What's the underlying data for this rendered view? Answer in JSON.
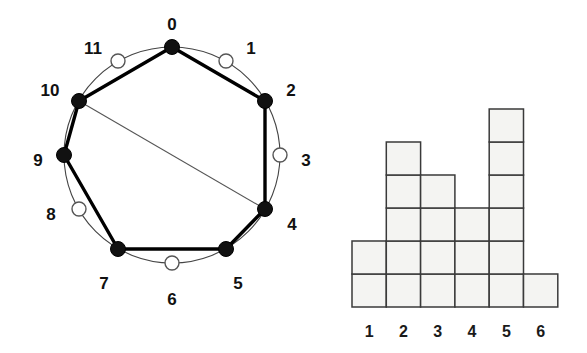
{
  "figure": {
    "background_color": "#ffffff"
  },
  "circle_diagram": {
    "name": "circular-node-diagram",
    "node_count": 12,
    "center": {
      "x": 172,
      "y": 155
    },
    "radius": 108,
    "filled_node_color": "#111111",
    "open_node_color": "#ffffff",
    "ring_color": "#444444",
    "chord_color": "#000000",
    "nodes": [
      {
        "id": 0,
        "label": "0",
        "state": "filled",
        "angle_deg": 270,
        "cx": 172,
        "cy": 47,
        "label_x": 172,
        "label_y": 26,
        "label_anchor": "middle"
      },
      {
        "id": 1,
        "label": "1",
        "state": "open",
        "angle_deg": 300,
        "cx": 226,
        "cy": 61,
        "label_x": 251,
        "label_y": 50,
        "label_anchor": "middle"
      },
      {
        "id": 2,
        "label": "2",
        "state": "filled",
        "angle_deg": 330,
        "cx": 265,
        "cy": 101,
        "label_x": 291,
        "label_y": 92,
        "label_anchor": "middle"
      },
      {
        "id": 3,
        "label": "3",
        "state": "open",
        "angle_deg": 0,
        "cx": 280,
        "cy": 155,
        "label_x": 306,
        "label_y": 162,
        "label_anchor": "middle"
      },
      {
        "id": 4,
        "label": "4",
        "state": "filled",
        "angle_deg": 30,
        "cx": 265,
        "cy": 209,
        "label_x": 292,
        "label_y": 226,
        "label_anchor": "middle"
      },
      {
        "id": 5,
        "label": "5",
        "state": "filled",
        "angle_deg": 60,
        "cx": 226,
        "cy": 249,
        "label_x": 238,
        "label_y": 285,
        "label_anchor": "middle"
      },
      {
        "id": 6,
        "label": "6",
        "state": "open",
        "angle_deg": 90,
        "cx": 172,
        "cy": 263,
        "label_x": 172,
        "label_y": 301,
        "label_anchor": "middle"
      },
      {
        "id": 7,
        "label": "7",
        "state": "filled",
        "angle_deg": 120,
        "cx": 118,
        "cy": 249,
        "label_x": 104,
        "label_y": 285,
        "label_anchor": "middle"
      },
      {
        "id": 8,
        "label": "8",
        "state": "open",
        "angle_deg": 150,
        "cx": 79,
        "cy": 209,
        "label_x": 51,
        "label_y": 216,
        "label_anchor": "middle"
      },
      {
        "id": 9,
        "label": "9",
        "state": "filled",
        "angle_deg": 180,
        "cx": 64,
        "cy": 155,
        "label_x": 38,
        "label_y": 162,
        "label_anchor": "middle"
      },
      {
        "id": 10,
        "label": "10",
        "state": "filled",
        "angle_deg": 210,
        "cx": 79,
        "cy": 101,
        "label_x": 50,
        "label_y": 92,
        "label_anchor": "middle"
      },
      {
        "id": 11,
        "label": "11",
        "state": "open",
        "angle_deg": 240,
        "cx": 118,
        "cy": 61,
        "label_x": 93,
        "label_y": 50,
        "label_anchor": "middle"
      }
    ],
    "edges": [
      {
        "from": 0,
        "to": 2,
        "weight": "thick"
      },
      {
        "from": 2,
        "to": 4,
        "weight": "thick"
      },
      {
        "from": 4,
        "to": 5,
        "weight": "thick"
      },
      {
        "from": 5,
        "to": 7,
        "weight": "thick"
      },
      {
        "from": 7,
        "to": 9,
        "weight": "thick"
      },
      {
        "from": 9,
        "to": 10,
        "weight": "thick"
      },
      {
        "from": 10,
        "to": 0,
        "weight": "thick"
      },
      {
        "from": 10,
        "to": 4,
        "weight": "thin"
      }
    ]
  },
  "chart_data": {
    "type": "bar",
    "title": "",
    "xlabel": "",
    "ylabel": "",
    "categories": [
      "1",
      "2",
      "3",
      "4",
      "5",
      "6"
    ],
    "values": [
      2,
      5,
      4,
      3,
      6,
      1
    ],
    "ylim": [
      0,
      6
    ],
    "grid": false,
    "legend": false,
    "style": "unit-cell stacked squares",
    "cell_fill": "#f4f4f2",
    "cell_stroke": "#3a3a3a",
    "geometry": {
      "left": 22,
      "baseline": 307,
      "cell_width": 34.3,
      "cell_height": 33.0,
      "tick_label_y": 333
    }
  }
}
